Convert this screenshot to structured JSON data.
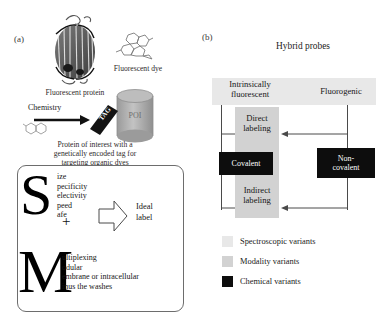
{
  "panel_a": {
    "label": "(a)",
    "protein_caption": "Fluorescent protein",
    "dye_caption": "Fluorescent dye",
    "poi_label": "POI",
    "tag_label": "TAG",
    "chemistry_label": "Chemistry",
    "poi_caption": "Protein of interest with a genetically encoded tag for targeting organic dyes",
    "poi_caption_lines": [
      "Protein of interest with a",
      "genetically encoded tag for",
      "targeting organic dyes"
    ],
    "acronym_s": {
      "letter": "S",
      "items": [
        "ize",
        "pecificity",
        "electivity",
        "peed",
        "afe"
      ],
      "full_words": [
        "Size",
        "Specificity",
        "Selectivity",
        "Speed",
        "Safe"
      ]
    },
    "plus": "+",
    "acronym_m": {
      "letter": "M",
      "items": [
        "ultiplexing",
        "odular",
        "embrane or intracellular",
        "inus the washes"
      ],
      "full_words": [
        "Multiplexing",
        "Modular",
        "Membrane or intracellular",
        "Minus the washes"
      ]
    },
    "ideal_label_lines": [
      "Ideal",
      "label"
    ],
    "arrow_icon": "block-arrow-right-icon"
  },
  "panel_b": {
    "label": "(b)",
    "title": "Hybrid probes",
    "top_left_lines": [
      "Intrinsically",
      "fluorescent"
    ],
    "top_right": "Fluorogenic",
    "center_top_lines": [
      "Direct",
      "labeling"
    ],
    "center_bottom_lines": [
      "Indirect",
      "labeling"
    ],
    "box_left": "Covalent",
    "box_right_lines": [
      "Non-",
      "covalent"
    ],
    "legend": [
      {
        "label": "Spectroscopic variants",
        "color": "#e8e8e8",
        "name": "spectroscopic-variants"
      },
      {
        "label": "Modality variants",
        "color": "#d2d2d2",
        "name": "modality-variants"
      },
      {
        "label": "Chemical variants",
        "color": "#0d0d0d",
        "name": "chemical-variants"
      }
    ]
  },
  "colors": {
    "band_gray": "#e8e8e8",
    "column_gray": "#d2d2d2",
    "black_box": "#0d0d0d",
    "cylinder_gray": "#a8a8a8",
    "line": "#4a4a4a"
  }
}
